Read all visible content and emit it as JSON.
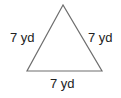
{
  "diagram": {
    "shape": "equilateral-triangle",
    "stroke_color": "#6e6e6e",
    "vertices": [
      [
        63,
        5
      ],
      [
        27,
        71
      ],
      [
        102,
        71
      ]
    ],
    "labels": {
      "left": "7 yd",
      "right": "7 yd",
      "bottom": "7 yd"
    }
  }
}
